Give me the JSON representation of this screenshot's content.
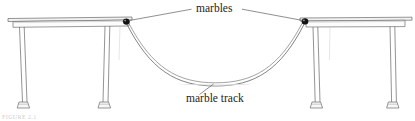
{
  "figure": {
    "labels": {
      "marbles": "marbles",
      "marble_track": "marble track",
      "caption_partial": "FIGURE 2.1"
    },
    "colors": {
      "line": "#5a5a5a",
      "line_light": "#8d8d8d",
      "marble": "#151515",
      "text": "#1c1c1c",
      "background": "#ffffff",
      "table_fill": "#fbfbfb"
    },
    "objects": [
      {
        "name": "left-table",
        "top_x": 8,
        "top_y": 18,
        "top_width": 124,
        "legs": [
          "front-left",
          "front-right"
        ]
      },
      {
        "name": "right-table",
        "top_x": 300,
        "top_y": 18,
        "top_width": 110,
        "legs": [
          "front-left",
          "front-right"
        ]
      },
      {
        "name": "marble-left",
        "x": 126,
        "y": 22
      },
      {
        "name": "marble-right",
        "x": 305,
        "y": 22
      },
      {
        "name": "marble-track-curve",
        "start": [
          126,
          22
        ],
        "lowest": [
          215,
          83
        ],
        "end": [
          305,
          22
        ]
      }
    ],
    "leaders": [
      {
        "name": "marbles-leader-left",
        "from": [
          128,
          23
        ],
        "to": [
          192,
          9
        ]
      },
      {
        "name": "marbles-leader-right",
        "from": [
          303,
          23
        ],
        "to": [
          243,
          9
        ]
      },
      {
        "name": "track-leader",
        "from": [
          213,
          83
        ],
        "to": [
          199,
          93
        ]
      }
    ]
  }
}
